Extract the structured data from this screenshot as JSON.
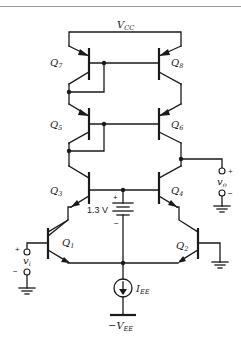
{
  "figure": {
    "supply_top": "V",
    "supply_top_sub": "CC",
    "supply_bottom": "−V",
    "supply_bottom_sub": "EE",
    "bias_source": "I",
    "bias_source_sub": "EE",
    "battery_label": "1.3 V",
    "battery_plus": "+",
    "battery_minus": "−"
  },
  "transistors": [
    {
      "id": "Q7",
      "name": "Q",
      "sub": "7",
      "type": "pnp"
    },
    {
      "id": "Q8",
      "name": "Q",
      "sub": "8",
      "type": "pnp"
    },
    {
      "id": "Q5",
      "name": "Q",
      "sub": "5",
      "type": "pnp"
    },
    {
      "id": "Q6",
      "name": "Q",
      "sub": "6",
      "type": "pnp"
    },
    {
      "id": "Q3",
      "name": "Q",
      "sub": "3",
      "type": "npn"
    },
    {
      "id": "Q4",
      "name": "Q",
      "sub": "4",
      "type": "npn"
    },
    {
      "id": "Q1",
      "name": "Q",
      "sub": "1",
      "type": "npn"
    },
    {
      "id": "Q2",
      "name": "Q",
      "sub": "2",
      "type": "npn"
    }
  ],
  "ports": {
    "input": {
      "name": "v",
      "sub": "i",
      "plus": "+",
      "minus": "−"
    },
    "output": {
      "name": "v",
      "sub": "o",
      "plus": "+",
      "minus": "−"
    }
  }
}
